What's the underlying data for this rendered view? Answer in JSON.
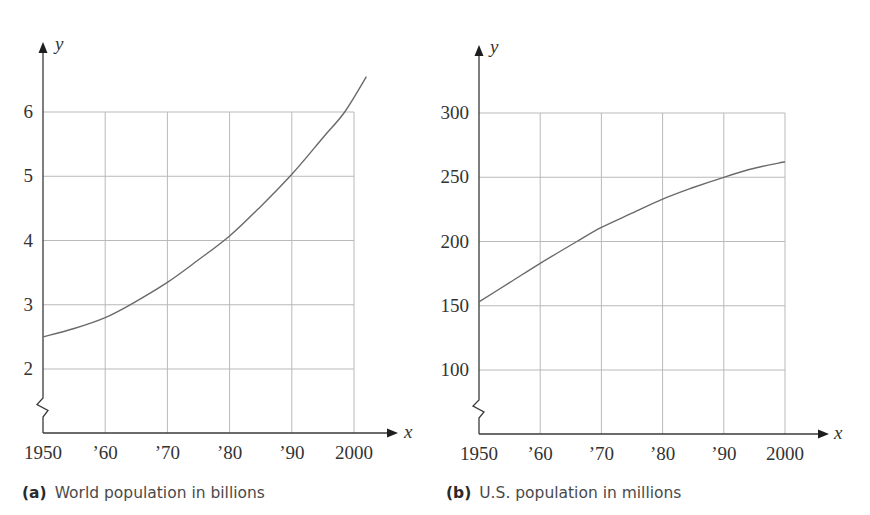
{
  "chart_data": [
    {
      "type": "line",
      "id": "a",
      "title": "World population in billions",
      "caption_tag": "(a)",
      "xlabel": "x",
      "ylabel": "y",
      "x_ticks": [
        1950,
        1960,
        1970,
        1980,
        1990,
        2000
      ],
      "x_tick_labels": [
        "1950",
        "’60",
        "’70",
        "’80",
        "’90",
        "2000"
      ],
      "y_ticks": [
        2,
        3,
        4,
        5,
        6
      ],
      "y_tick_labels": [
        "2",
        "3",
        "4",
        "5",
        "6"
      ],
      "xlim": [
        1950,
        2000
      ],
      "ylim": [
        1,
        6
      ],
      "y_axis_break": true,
      "grid": true,
      "series": [
        {
          "name": "World population (billions)",
          "x": [
            1950,
            1955,
            1960,
            1964,
            1970,
            1975,
            1980,
            1985,
            1990,
            1995,
            1998.5,
            2002
          ],
          "values": [
            2.5,
            2.63,
            2.8,
            3.0,
            3.35,
            3.7,
            4.07,
            4.53,
            5.03,
            5.6,
            6.0,
            6.55
          ]
        }
      ]
    },
    {
      "type": "line",
      "id": "b",
      "title": "U.S. population in millions",
      "caption_tag": "(b)",
      "xlabel": "x",
      "ylabel": "y",
      "x_ticks": [
        1950,
        1960,
        1970,
        1980,
        1990,
        2000
      ],
      "x_tick_labels": [
        "1950",
        "’60",
        "’70",
        "’80",
        "’90",
        "2000"
      ],
      "y_ticks": [
        100,
        150,
        200,
        250,
        300
      ],
      "y_tick_labels": [
        "100",
        "150",
        "200",
        "250",
        "300"
      ],
      "xlim": [
        1950,
        2000
      ],
      "ylim": [
        50,
        300
      ],
      "y_axis_break": true,
      "grid": true,
      "series": [
        {
          "name": "U.S. population (millions)",
          "x": [
            1950,
            1955,
            1960,
            1966,
            1970,
            1975,
            1980,
            1985,
            1990,
            1995,
            2000
          ],
          "values": [
            153,
            168,
            183,
            200,
            211,
            222,
            233,
            242,
            250,
            257,
            262
          ]
        }
      ]
    }
  ],
  "captions": {
    "a": {
      "tag": "(a)",
      "text": "World population in billions"
    },
    "b": {
      "tag": "(b)",
      "text": "U.S. population in millions"
    }
  }
}
